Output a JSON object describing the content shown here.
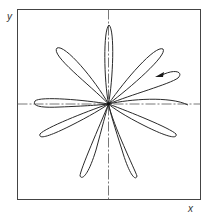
{
  "diagram": {
    "type": "polar rose curve in Cartesian frame",
    "axis_labels": {
      "x": "x",
      "y": "y"
    },
    "petal_count": 10,
    "colors": {
      "curve": "#2a2a2a",
      "frame": "#444444",
      "axis": "#555555",
      "background": "#ffffff"
    },
    "annotations": [
      "direction arrow on upper-right petal pointing inward (left)"
    ]
  }
}
